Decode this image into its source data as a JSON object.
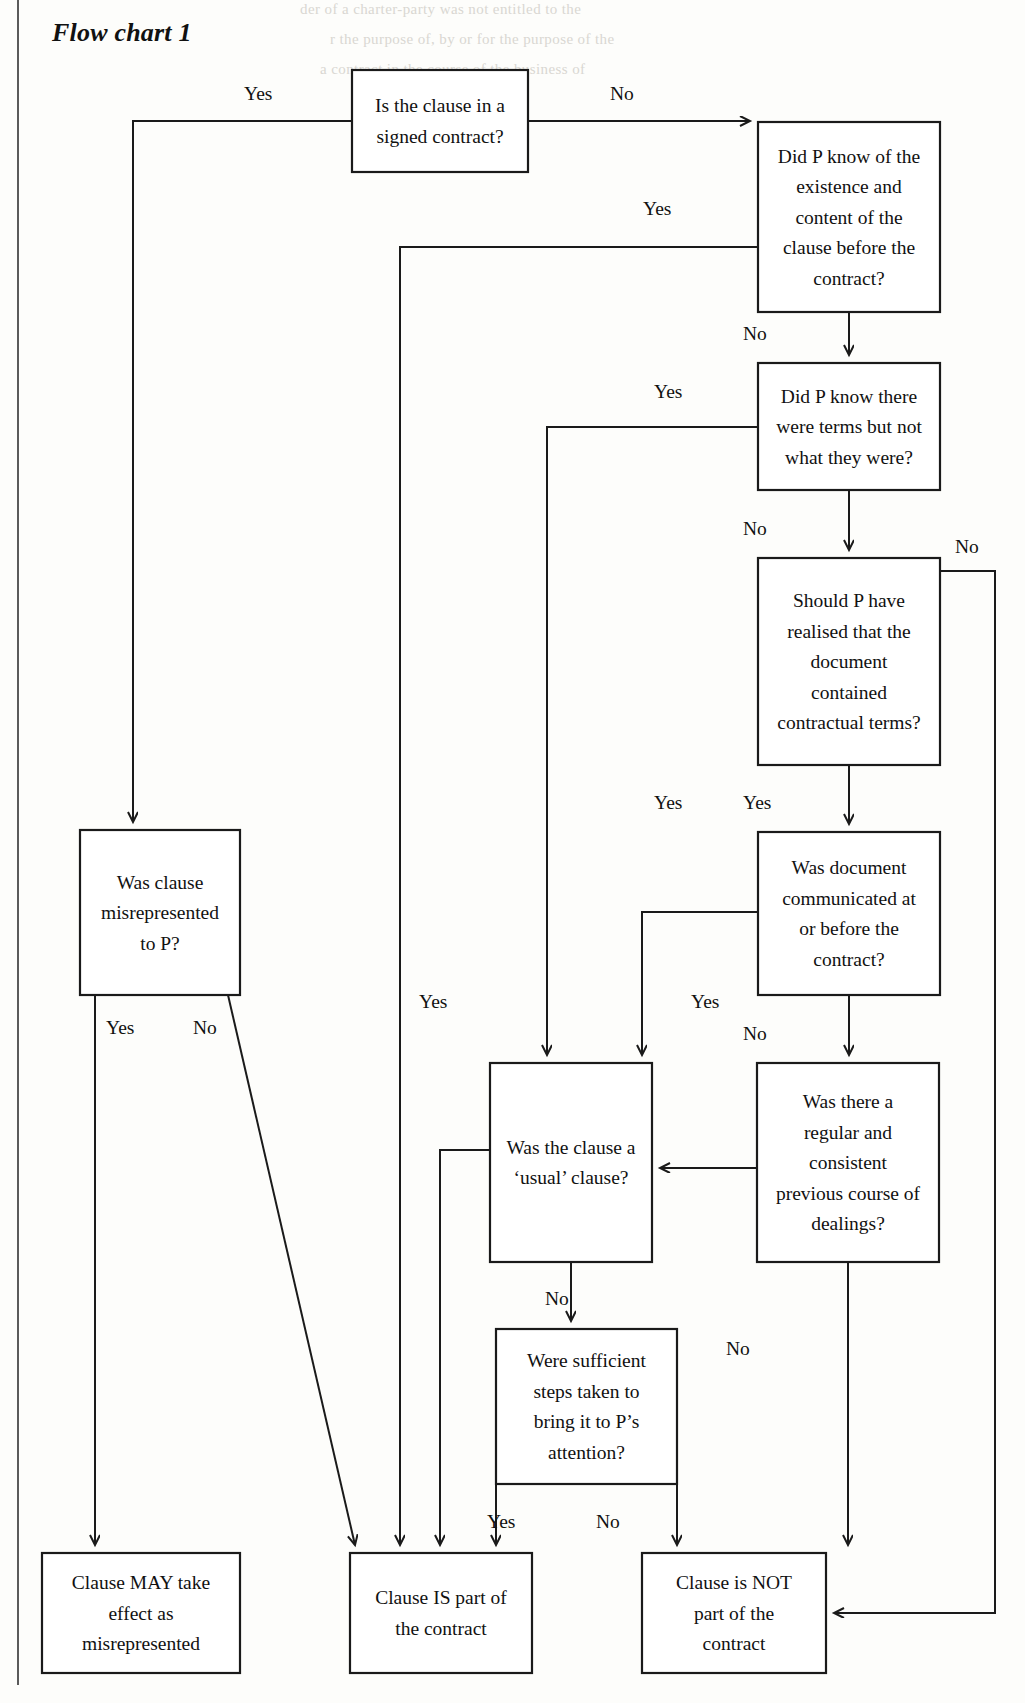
{
  "page": {
    "title": "Flow chart 1",
    "background_color": "#fdfdfb",
    "ink_color": "#1a1a1a",
    "margin_rule_color": "#5b5b5b"
  },
  "chart_data": {
    "type": "diagram",
    "diagram_kind": "decision-flowchart",
    "title": "Flow chart 1",
    "nodes": [
      {
        "id": "n1",
        "kind": "decision",
        "text": "Is the clause in a signed contract?",
        "lines": [
          "Is the clause in a",
          "signed contract?"
        ],
        "x": 352,
        "y": 70,
        "w": 176,
        "h": 102
      },
      {
        "id": "n2",
        "kind": "decision",
        "text": "Did P know of the existence and content of the clause before the contract?",
        "lines": [
          "Did P know of the",
          "existence and",
          "content of the",
          "clause before the",
          "contract?"
        ],
        "x": 758,
        "y": 122,
        "w": 182,
        "h": 190
      },
      {
        "id": "n3",
        "kind": "decision",
        "text": "Did P know there were terms but not what they were?",
        "lines": [
          "Did P know there",
          "were terms but not",
          "what they were?"
        ],
        "x": 758,
        "y": 363,
        "w": 182,
        "h": 127
      },
      {
        "id": "n4",
        "kind": "decision",
        "text": "Should P have realised that the document contained contractual terms?",
        "lines": [
          "Should P have",
          "realised that the",
          "document",
          "contained",
          "contractual terms?"
        ],
        "x": 758,
        "y": 558,
        "w": 182,
        "h": 207
      },
      {
        "id": "n5",
        "kind": "decision",
        "text": "Was document communicated at or before the contract?",
        "lines": [
          "Was document",
          "communicated at",
          "or before the",
          "contract?"
        ],
        "x": 758,
        "y": 832,
        "w": 182,
        "h": 163
      },
      {
        "id": "n6",
        "kind": "decision",
        "text": "Was there a regular and consistent previous course of dealings?",
        "lines": [
          "Was there a",
          "regular and",
          "consistent",
          "previous course of",
          "dealings?"
        ],
        "x": 757,
        "y": 1063,
        "w": 182,
        "h": 199
      },
      {
        "id": "n7",
        "kind": "decision",
        "text": "Was the clause a ‘usual’ clause?",
        "lines": [
          "Was the clause a",
          "‘usual’ clause?"
        ],
        "x": 490,
        "y": 1063,
        "w": 162,
        "h": 199
      },
      {
        "id": "n8",
        "kind": "decision",
        "text": "Were sufficient steps taken to bring it to P’s attention?",
        "lines": [
          "Were sufficient",
          "steps taken to",
          "bring it to P’s",
          "attention?"
        ],
        "x": 496,
        "y": 1329,
        "w": 181,
        "h": 155
      },
      {
        "id": "n9",
        "kind": "decision",
        "text": "Was clause misrepresented to P?",
        "lines": [
          "Was clause",
          "misrepresented",
          "to P?"
        ],
        "x": 80,
        "y": 830,
        "w": 160,
        "h": 165
      },
      {
        "id": "n10",
        "kind": "terminal",
        "text": "Clause MAY take effect as misrepresented",
        "lines": [
          "Clause MAY take",
          "effect as",
          "misrepresented"
        ],
        "x": 42,
        "y": 1553,
        "w": 198,
        "h": 120
      },
      {
        "id": "n11",
        "kind": "terminal",
        "text": "Clause IS part of the contract",
        "lines": [
          "Clause IS part of",
          "the contract"
        ],
        "x": 350,
        "y": 1553,
        "w": 182,
        "h": 120
      },
      {
        "id": "n12",
        "kind": "terminal",
        "text": "Clause is NOT part of the contract",
        "lines": [
          "Clause is NOT",
          "part of the",
          "contract"
        ],
        "x": 642,
        "y": 1553,
        "w": 184,
        "h": 120
      }
    ],
    "edges": [
      {
        "from": "n1",
        "to": "n9",
        "label": "Yes",
        "label_x": 244,
        "label_y": 100
      },
      {
        "from": "n1",
        "to": "n2",
        "label": "No",
        "label_x": 610,
        "label_y": 100
      },
      {
        "from": "n2",
        "to": "n11",
        "label": "Yes",
        "label_x": 643,
        "label_y": 215
      },
      {
        "from": "n2",
        "to": "n3",
        "label": "No",
        "label_x": 743,
        "label_y": 340
      },
      {
        "from": "n3",
        "to": "n11",
        "label": "Yes",
        "label_x": 654,
        "label_y": 398
      },
      {
        "from": "n3",
        "to": "n4",
        "label": "No",
        "label_x": 743,
        "label_y": 535
      },
      {
        "from": "n4",
        "to": "n12",
        "label": "No",
        "label_x": 955,
        "label_y": 553
      },
      {
        "from": "n4",
        "to": "n5",
        "label": "Yes",
        "label_x": 743,
        "label_y": 809
      },
      {
        "from": "n5",
        "to": "n7",
        "label": "Yes",
        "label_x": 654,
        "label_y": 809
      },
      {
        "from": "n5",
        "to": "n6",
        "label": "No",
        "label_x": 743,
        "label_y": 1040
      },
      {
        "from": "n6",
        "to": "n7",
        "label": "Yes",
        "label_x": 691,
        "label_y": 1008
      },
      {
        "from": "n6",
        "to": "n12",
        "label": "No",
        "label_x": 726,
        "label_y": 1355
      },
      {
        "from": "n7",
        "to": "n11",
        "label": "Yes",
        "label_x": 419,
        "label_y": 1008
      },
      {
        "from": "n7",
        "to": "n8",
        "label": "No",
        "label_x": 545,
        "label_y": 1305
      },
      {
        "from": "n8",
        "to": "n11",
        "label": "Yes",
        "label_x": 487,
        "label_y": 1528
      },
      {
        "from": "n8",
        "to": "n12",
        "label": "No",
        "label_x": 596,
        "label_y": 1528
      },
      {
        "from": "n9",
        "to": "n10",
        "label": "Yes",
        "label_x": 106,
        "label_y": 1034
      },
      {
        "from": "n9",
        "to": "n11",
        "label": "No",
        "label_x": 193,
        "label_y": 1034
      }
    ],
    "labels": [
      "Yes",
      "No"
    ],
    "terminal_outcomes": [
      "Clause MAY take effect as misrepresented",
      "Clause IS part of the contract",
      "Clause is NOT part of the contract"
    ]
  },
  "ghost_text": {
    "top": "der of a charter-party was not entitled to the",
    "lines": [
      "r the purpose of, by or for the purpose of the",
      "a contract in the course of the business of",
      "sed in a contract to exclude or restrict the"
    ]
  }
}
